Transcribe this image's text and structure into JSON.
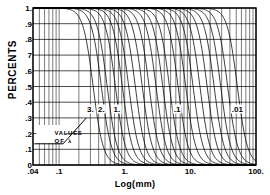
{
  "chart_data": {
    "type": "line",
    "title": "",
    "xlabel": "Log(mm)",
    "ylabel": "PERCENTS",
    "xscale": "log",
    "xlim": [
      0.04,
      100
    ],
    "ylim": [
      0,
      1
    ],
    "grid": true,
    "legend_position": "inline-labels",
    "xticks": [
      {
        "value": 0.04,
        "label": ".04"
      },
      {
        "value": 0.1,
        "label": ".1"
      },
      {
        "value": 1,
        "label": "1."
      },
      {
        "value": 10,
        "label": "10."
      },
      {
        "value": 100,
        "label": "100."
      }
    ],
    "yticks": [
      {
        "value": 1.0,
        "label": "1."
      },
      {
        "value": 0.9,
        "label": ".9"
      },
      {
        "value": 0.8,
        "label": ".8"
      },
      {
        "value": 0.7,
        "label": "7"
      },
      {
        "value": 0.6,
        "label": ".6"
      },
      {
        "value": 0.5,
        "label": ".5"
      },
      {
        "value": 0.4,
        "label": ".4"
      },
      {
        "value": 0.3,
        "label": ".3"
      },
      {
        "value": 0.2,
        "label": ".2"
      },
      {
        "value": 0.1,
        "label": ".1"
      },
      {
        "value": 0.0,
        "label": "0"
      }
    ],
    "annotations": [
      {
        "name": "values-of-lambda",
        "line1": "VALUES",
        "line2": "OF  λ",
        "x": 0.085,
        "y": 0.185,
        "arrow_to_x": 0.26,
        "arrow_to_y": 0.3
      }
    ],
    "series_param_name": "λ",
    "series": [
      {
        "name": "3.",
        "lambda": 3.0,
        "midpoint_mm": 0.33,
        "labeled": true,
        "label_x": 0.3,
        "label_y": 0.355
      },
      {
        "name": "2.",
        "lambda": 2.0,
        "midpoint_mm": 0.44,
        "labeled": true,
        "label_x": 0.44,
        "label_y": 0.355
      },
      {
        "name": "",
        "lambda": 1.6,
        "midpoint_mm": 0.54,
        "labeled": false
      },
      {
        "name": "1.",
        "lambda": 1.0,
        "midpoint_mm": 0.72,
        "labeled": true,
        "label_x": 0.76,
        "label_y": 0.355
      },
      {
        "name": "",
        "lambda": 0.8,
        "midpoint_mm": 0.92,
        "labeled": false
      },
      {
        "name": "",
        "lambda": 0.65,
        "midpoint_mm": 1.15,
        "labeled": false
      },
      {
        "name": "",
        "lambda": 0.5,
        "midpoint_mm": 1.45,
        "labeled": false
      },
      {
        "name": "",
        "lambda": 0.4,
        "midpoint_mm": 1.85,
        "labeled": false
      },
      {
        "name": "",
        "lambda": 0.32,
        "midpoint_mm": 2.35,
        "labeled": false
      },
      {
        "name": "",
        "lambda": 0.25,
        "midpoint_mm": 3.0,
        "labeled": false
      },
      {
        "name": "",
        "lambda": 0.2,
        "midpoint_mm": 3.8,
        "labeled": false
      },
      {
        "name": "",
        "lambda": 0.16,
        "midpoint_mm": 4.8,
        "labeled": false
      },
      {
        "name": ".1",
        "lambda": 0.1,
        "midpoint_mm": 6.5,
        "labeled": true,
        "label_x": 6.3,
        "label_y": 0.355
      },
      {
        "name": "",
        "lambda": 0.08,
        "midpoint_mm": 8.5,
        "labeled": false
      },
      {
        "name": "",
        "lambda": 0.065,
        "midpoint_mm": 11.0,
        "labeled": false
      },
      {
        "name": "",
        "lambda": 0.05,
        "midpoint_mm": 14.0,
        "labeled": false
      },
      {
        "name": "",
        "lambda": 0.04,
        "midpoint_mm": 18.0,
        "labeled": false
      },
      {
        "name": "",
        "lambda": 0.032,
        "midpoint_mm": 23.0,
        "labeled": false
      },
      {
        "name": "",
        "lambda": 0.025,
        "midpoint_mm": 29.0,
        "labeled": false
      },
      {
        "name": "",
        "lambda": 0.02,
        "midpoint_mm": 37.0,
        "labeled": false
      },
      {
        "name": ".01",
        "lambda": 0.01,
        "midpoint_mm": 52.0,
        "labeled": true,
        "label_x": 52.0,
        "label_y": 0.355
      }
    ],
    "curve_color": "#000000",
    "grid_color": "#000000",
    "background_color": "#ffffff"
  }
}
